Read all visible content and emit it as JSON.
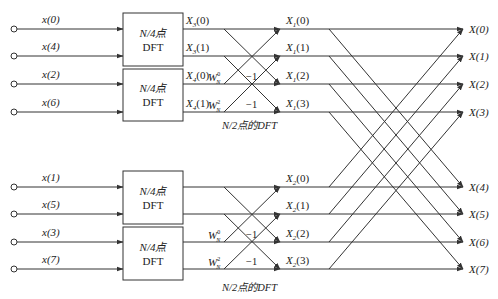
{
  "stage1_blocks": [
    {
      "line1": "N/4点",
      "line2": "DFT",
      "inputs": [
        "x(0)",
        "x(4)"
      ],
      "outputs": [
        "X3(0)",
        "X3(1)"
      ]
    },
    {
      "line1": "N/4点",
      "line2": "DFT",
      "inputs": [
        "x(2)",
        "x(6)"
      ],
      "outputs": [
        "X4(0)",
        "X4(1)"
      ]
    },
    {
      "line1": "N/4点",
      "line2": "DFT",
      "inputs": [
        "x(1)",
        "x(5)"
      ],
      "outputs": [
        "",
        ""
      ]
    },
    {
      "line1": "N/4点",
      "line2": "DFT",
      "inputs": [
        "x(3)",
        "x(7)"
      ],
      "outputs": [
        "",
        ""
      ]
    }
  ],
  "inputs": [
    "x(0)",
    "x(4)",
    "x(2)",
    "x(6)",
    "x(1)",
    "x(5)",
    "x(3)",
    "x(7)"
  ],
  "block_outputs": [
    {
      "base": "X",
      "sub": "3",
      "arg": "(0)"
    },
    {
      "base": "X",
      "sub": "3",
      "arg": "(1)"
    },
    {
      "base": "X",
      "sub": "4",
      "arg": "(0)"
    },
    {
      "base": "X",
      "sub": "4",
      "arg": "(1)"
    }
  ],
  "twiddles": [
    {
      "base": "W",
      "sup": "0",
      "sub": "N"
    },
    {
      "base": "W",
      "sup": "2",
      "sub": "N"
    },
    {
      "base": "W",
      "sup": "0",
      "sub": "N"
    },
    {
      "base": "W",
      "sup": "2",
      "sub": "N"
    }
  ],
  "minus_one": "−1",
  "stage2_outputs_upper": [
    {
      "base": "X",
      "sub": "1",
      "arg": "(0)"
    },
    {
      "base": "X",
      "sub": "1",
      "arg": "(1)"
    },
    {
      "base": "X",
      "sub": "1",
      "arg": "(2)"
    },
    {
      "base": "X",
      "sub": "1",
      "arg": "(3)"
    }
  ],
  "stage2_outputs_lower": [
    {
      "base": "X",
      "sub": "2",
      "arg": "(0)"
    },
    {
      "base": "X",
      "sub": "2",
      "arg": "(1)"
    },
    {
      "base": "X",
      "sub": "2",
      "arg": "(2)"
    },
    {
      "base": "X",
      "sub": "2",
      "arg": "(3)"
    }
  ],
  "stage2_caption": "N/2点的DFT",
  "final_outputs": [
    "X(0)",
    "X(1)",
    "X(2)",
    "X(3)",
    "X(4)",
    "X(5)",
    "X(6)",
    "X(7)"
  ],
  "colors": {
    "line": "#333333",
    "text": "#222222",
    "background": "#ffffff"
  }
}
